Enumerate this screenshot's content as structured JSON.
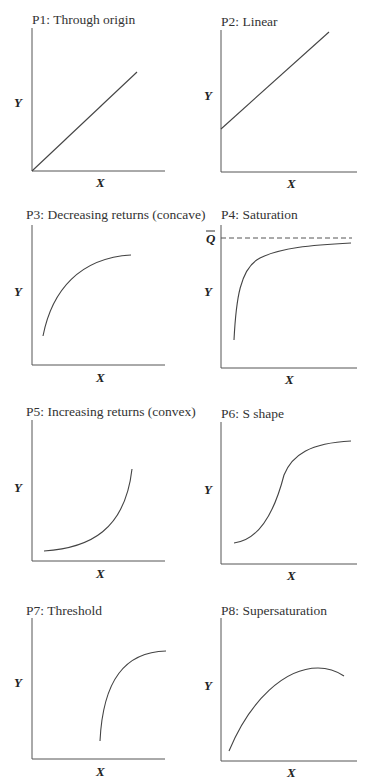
{
  "panels": [
    {
      "id": "P1",
      "title": "P1: Through origin",
      "xlabel": "X",
      "ylabel": "Y"
    },
    {
      "id": "P2",
      "title": "P2: Linear",
      "xlabel": "X",
      "ylabel": "Y"
    },
    {
      "id": "P3",
      "title": "P3: Decreasing returns (concave)",
      "xlabel": "X",
      "ylabel": "Y"
    },
    {
      "id": "P4",
      "title": "P4: Saturation",
      "xlabel": "X",
      "ylabel": "Y",
      "asymptote_label": "Q"
    },
    {
      "id": "P5",
      "title": "P5: Increasing returns (convex)",
      "xlabel": "X",
      "ylabel": "Y"
    },
    {
      "id": "P6",
      "title": "P6: S shape",
      "xlabel": "X",
      "ylabel": "Y"
    },
    {
      "id": "P7",
      "title": "P7: Threshold",
      "xlabel": "X",
      "ylabel": "Y"
    },
    {
      "id": "P8",
      "title": "P8: Supersaturation",
      "xlabel": "X",
      "ylabel": "Y"
    }
  ],
  "colors": {
    "line": "#444444",
    "axis": "#555555",
    "background": "#ffffff"
  }
}
